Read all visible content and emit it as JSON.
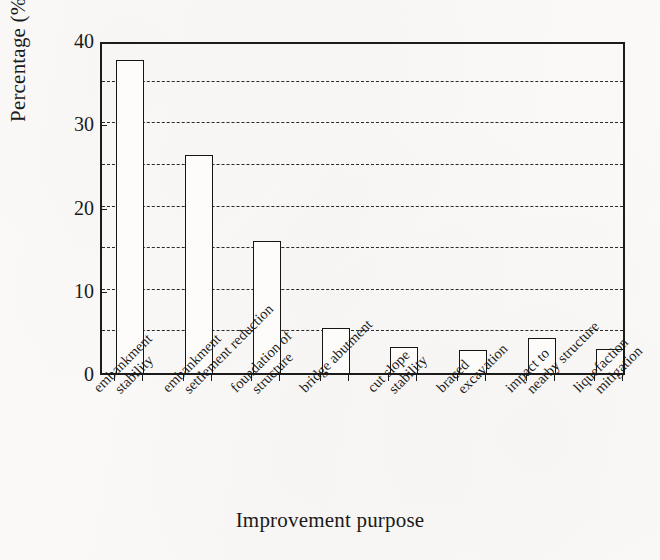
{
  "chart_data": {
    "type": "bar",
    "title": "",
    "xlabel": "Improvement purpose",
    "ylabel": "Percentage (%)",
    "ylim": [
      0,
      40
    ],
    "ytick_labels": [
      "0",
      "10",
      "20",
      "30",
      "40"
    ],
    "ytick_values": [
      0,
      10,
      20,
      30,
      40
    ],
    "gridlines": [
      5,
      10,
      15,
      20,
      25,
      30,
      35
    ],
    "grid": true,
    "grid_style": "dashed-horizontal",
    "legend": "none",
    "bar_fill_color": "#ffffff",
    "bar_edge_color": "#161616",
    "categories": [
      "embankment stability",
      "embankment settlement reduction",
      "foundation of structure",
      "bridge abutment",
      "cut slope stability",
      "braced excavation",
      "impact to nearby structure",
      "liquefaction mitigation"
    ],
    "category_lines": [
      [
        "embankment",
        "stability"
      ],
      [
        "embankment",
        "settlement reduction"
      ],
      [
        "foundation of",
        "structure"
      ],
      [
        "bridge abutment",
        ""
      ],
      [
        "cut slope",
        "stability"
      ],
      [
        "braced",
        "excavation"
      ],
      [
        "impact to",
        "nearby structure"
      ],
      [
        "liquefaction",
        "mitigation"
      ]
    ],
    "values": [
      37.6,
      26.2,
      15.8,
      5.4,
      3.1,
      2.8,
      4.2,
      2.9
    ]
  }
}
